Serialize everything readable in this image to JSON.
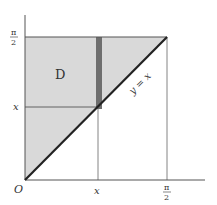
{
  "diagram": {
    "region_label": "D",
    "line_label": "y = x",
    "origin_label": "O",
    "x_tick_labels": [
      "x",
      "π/2"
    ],
    "y_tick_labels": [
      "x",
      "π/2"
    ],
    "pi_symbol": "π",
    "two": "2",
    "x_var": "x",
    "colors": {
      "region_fill": "#d9d9d9",
      "strip_fill": "#6e6e6e",
      "axis": "#555555",
      "diagonal": "#222222"
    }
  }
}
